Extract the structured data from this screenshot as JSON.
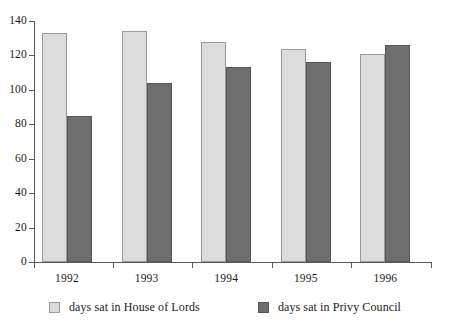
{
  "chart_data": {
    "type": "bar",
    "title": "",
    "subtitle": "",
    "xlabel": "",
    "ylabel": "",
    "categories": [
      "1992",
      "1993",
      "1994",
      "1995",
      "1996"
    ],
    "series": [
      {
        "name": "days sat in House of Lords",
        "color": "#dcdcdc",
        "values": [
          133,
          134,
          128,
          124,
          121
        ]
      },
      {
        "name": "days sat in Privy Council",
        "color": "#6e6e6e",
        "values": [
          85,
          104,
          113,
          116,
          126
        ]
      }
    ],
    "ylim": [
      0,
      140
    ],
    "yticks": [
      0,
      20,
      40,
      60,
      80,
      100,
      120,
      140
    ],
    "ytick_labels": [
      "0",
      "20",
      "40",
      "60",
      "80",
      "100",
      "120",
      "140"
    ],
    "grid": false,
    "legend_position": "bottom",
    "axis_color": "#5a5a5a"
  },
  "legend": {
    "entries": [
      {
        "label": "days sat in House of Lords",
        "swatch": "light-gray"
      },
      {
        "label": "days sat in Privy Council",
        "swatch": "dark-gray"
      }
    ]
  }
}
